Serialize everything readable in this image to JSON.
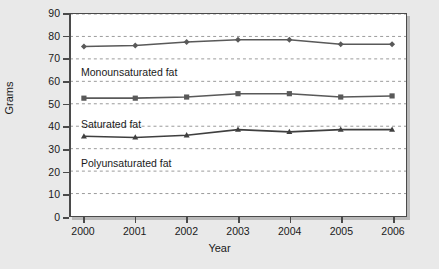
{
  "chart_data": {
    "type": "line",
    "title": "",
    "xlabel": "Year",
    "ylabel": "Grams",
    "categories": [
      "2000",
      "2001",
      "2002",
      "2003",
      "2004",
      "2005",
      "2006"
    ],
    "x": [
      2000,
      2001,
      2002,
      2003,
      2004,
      2005,
      2006
    ],
    "ylim": [
      0,
      90
    ],
    "ytick_step": 10,
    "yticks": [
      "90",
      "80",
      "70",
      "60",
      "50",
      "40",
      "30",
      "20",
      "10",
      "0"
    ],
    "grid": true,
    "grid_style": "dotted-horizontal",
    "legend_position": "inline-annotation",
    "series": [
      {
        "name": "Monounsaturated fat",
        "values": [
          75.5,
          76.0,
          77.5,
          78.5,
          78.5,
          76.5,
          76.5
        ],
        "color": "#595959",
        "marker": "diamond"
      },
      {
        "name": "Saturated fat",
        "values": [
          52.5,
          52.5,
          53.0,
          54.5,
          54.5,
          53.0,
          53.5
        ],
        "color": "#595959",
        "marker": "square"
      },
      {
        "name": "Polyunsaturated fat",
        "values": [
          35.5,
          35.0,
          36.0,
          38.5,
          37.5,
          38.5,
          38.5
        ],
        "color": "#3f3f3f",
        "marker": "triangle"
      }
    ],
    "annotations": [
      {
        "text": "Monounsaturated fat",
        "series": 0
      },
      {
        "text": "Saturated fat",
        "series": 1
      },
      {
        "text": "Polyunsaturated fat",
        "series": 2
      }
    ],
    "colors": {
      "plot_background": "#ffffff",
      "page_background": "#e9e9e9",
      "axis": "#4a4a4a",
      "gridline": "#9a9a9a",
      "text": "#1a1a1a"
    }
  }
}
